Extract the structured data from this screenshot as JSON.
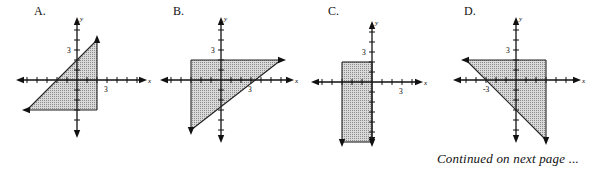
{
  "graphs": [
    {
      "label": "A.",
      "origin_px": [
        77,
        80
      ],
      "unit_px": 10,
      "x_tick_label": "3",
      "y_tick_label": "3",
      "axis_x_label": "x",
      "axis_y_label": "y",
      "region": {
        "description": "Region between y = x + 2 (upper-left boundary), x = 2 (right boundary), y = -3 (bottom boundary)",
        "vertices": [
          [
            -5,
            -3
          ],
          [
            2,
            4
          ],
          [
            2,
            -3
          ]
        ],
        "arrows": [
          {
            "at": [
              2,
              4
            ],
            "dir": "up"
          },
          {
            "at": [
              -5,
              -3
            ],
            "dir": "left"
          }
        ]
      }
    },
    {
      "label": "B.",
      "origin_px": [
        221,
        80
      ],
      "unit_px": 10,
      "x_tick_label": "3",
      "y_tick_label": "3",
      "axis_x_label": "x",
      "axis_y_label": "y",
      "region": {
        "description": "Region bounded by y = 2 (top), x = -3 (left), y = (7/9)x - 2/3 diagonal (lower-right)",
        "vertices": [
          [
            -3,
            2
          ],
          [
            6,
            2
          ],
          [
            -3,
            -5
          ]
        ],
        "arrows": [
          {
            "at": [
              6,
              2
            ],
            "dir": "right"
          },
          {
            "at": [
              -3,
              -5
            ],
            "dir": "down"
          }
        ]
      }
    },
    {
      "label": "C.",
      "origin_px": [
        372,
        82
      ],
      "unit_px": 10,
      "x_tick_label": "3",
      "y_tick_label": "3",
      "axis_x_label": "x",
      "axis_y_label": "y",
      "region": {
        "description": "Region -3 <= x <= 0, y <= 2",
        "vertices": [
          [
            -3,
            2
          ],
          [
            0,
            2
          ],
          [
            0,
            -6
          ],
          [
            -3,
            -6
          ]
        ],
        "arrows": [
          {
            "at": [
              -3,
              -6
            ],
            "dir": "down"
          },
          {
            "at": [
              0,
              -6
            ],
            "dir": "down"
          }
        ]
      }
    },
    {
      "label": "D.",
      "origin_px": [
        516,
        80
      ],
      "unit_px": 10,
      "x_tick_label": "-3",
      "y_tick_label": "3",
      "axis_x_label": "x",
      "axis_y_label": "y",
      "region": {
        "description": "Region bounded by y = 2 (top), x = 3 (right), y = -x - 3 diagonal (lower-left)",
        "vertices": [
          [
            -5,
            2
          ],
          [
            3,
            2
          ],
          [
            3,
            -6
          ]
        ],
        "arrows": [
          {
            "at": [
              -5,
              2
            ],
            "dir": "left"
          },
          {
            "at": [
              3,
              -6
            ],
            "dir": "down"
          }
        ]
      }
    }
  ],
  "footer": "Continued on next page ..."
}
